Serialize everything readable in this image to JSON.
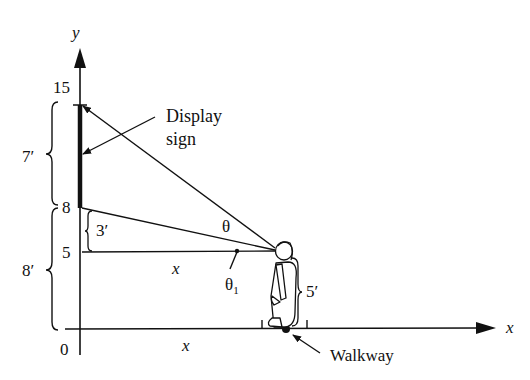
{
  "axes": {
    "x_label": "x",
    "y_label": "y",
    "origin_label": "0",
    "y_ticks": [
      {
        "value": "15",
        "y": 105
      },
      {
        "value": "8",
        "y": 207
      },
      {
        "value": "5",
        "y": 252
      }
    ]
  },
  "dimensions": {
    "sign_height": "7′",
    "sign_bottom_height": "8′",
    "eye_to_sign_bottom": "3′",
    "person_eye_height": "5′",
    "horizontal_distance_upper": "x",
    "horizontal_distance_lower": "x"
  },
  "angles": {
    "theta": "θ",
    "theta1": "θ",
    "theta1_sub": "1"
  },
  "annotations": {
    "sign_line1": "Display",
    "sign_line2": "sign",
    "walkway": "Walkway"
  },
  "colors": {
    "ink": "#111111",
    "background": "#ffffff"
  }
}
